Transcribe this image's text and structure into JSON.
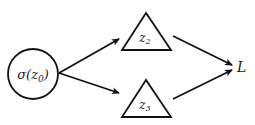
{
  "diagram": {
    "type": "computation-graph",
    "colors": {
      "stroke": "#111111",
      "background": "#ffffff",
      "text": "#1a1a1a"
    },
    "nodes": [
      {
        "id": "sigma_z0",
        "shape": "circle",
        "label": "σ(z",
        "sub": "0",
        "suffix": ")",
        "cx": 33,
        "cy": 74,
        "r": 25
      },
      {
        "id": "z2",
        "shape": "triangle",
        "label": "z",
        "sub": "2",
        "apex": [
          146,
          13
        ],
        "base_left": [
          122,
          50
        ],
        "base_right": [
          171,
          50
        ]
      },
      {
        "id": "z3",
        "shape": "triangle",
        "label": "z",
        "sub": "3",
        "apex": [
          146,
          80
        ],
        "base_left": [
          122,
          117
        ],
        "base_right": [
          171,
          117
        ]
      },
      {
        "id": "L",
        "shape": "text",
        "label": "L",
        "x": 240,
        "y": 72
      }
    ],
    "edges": [
      {
        "from": "sigma_z0",
        "to": "z2",
        "x1": 59,
        "y1": 73,
        "x2": 119,
        "y2": 39
      },
      {
        "from": "sigma_z0",
        "to": "z3",
        "x1": 59,
        "y1": 73,
        "x2": 119,
        "y2": 93
      },
      {
        "from": "z2",
        "to": "L",
        "x1": 173,
        "y1": 36,
        "x2": 232,
        "y2": 65
      },
      {
        "from": "z3",
        "to": "L",
        "x1": 173,
        "y1": 99,
        "x2": 232,
        "y2": 70
      }
    ]
  }
}
